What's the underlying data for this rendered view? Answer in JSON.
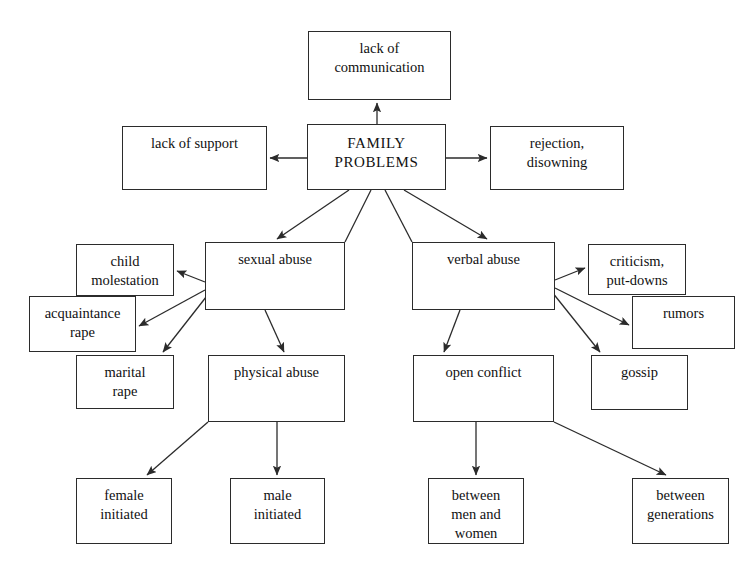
{
  "diagram": {
    "type": "concept-map",
    "title": "FAMILY PROBLEMS",
    "background_color": "#ffffff",
    "line_color": "#2b2b2b",
    "text_color": "#111111",
    "nodes": [
      {
        "id": "lack-of-communication",
        "label": "lack of\ncommunication",
        "x": 308,
        "y": 31,
        "w": 143,
        "h": 69,
        "level": "top"
      },
      {
        "id": "lack-of-support",
        "label": "lack of support",
        "x": 122,
        "y": 126,
        "w": 145,
        "h": 64,
        "level": "side"
      },
      {
        "id": "family-problems",
        "label": "FAMILY\nPROBLEMS",
        "x": 307,
        "y": 124,
        "w": 139,
        "h": 66,
        "level": "center"
      },
      {
        "id": "rejection-disowning",
        "label": "rejection,\ndisowning",
        "x": 490,
        "y": 126,
        "w": 134,
        "h": 64,
        "level": "side"
      },
      {
        "id": "sexual-abuse",
        "label": "sexual abuse",
        "x": 205,
        "y": 242,
        "w": 140,
        "h": 68,
        "level": "mid"
      },
      {
        "id": "verbal-abuse",
        "label": "verbal abuse",
        "x": 412,
        "y": 242,
        "w": 143,
        "h": 68,
        "level": "mid"
      },
      {
        "id": "child-molestation",
        "label": "child\nmolestation",
        "x": 76,
        "y": 244,
        "w": 98,
        "h": 52,
        "level": "leaf"
      },
      {
        "id": "acquaintance-rape",
        "label": "acquaintance\nrape",
        "x": 29,
        "y": 296,
        "w": 107,
        "h": 56,
        "level": "leaf"
      },
      {
        "id": "marital-rape",
        "label": "marital\nrape",
        "x": 76,
        "y": 355,
        "w": 98,
        "h": 54,
        "level": "leaf"
      },
      {
        "id": "criticism-put-downs",
        "label": "criticism,\nput-downs",
        "x": 588,
        "y": 244,
        "w": 98,
        "h": 51,
        "level": "leaf"
      },
      {
        "id": "rumors",
        "label": "rumors",
        "x": 632,
        "y": 296,
        "w": 103,
        "h": 53,
        "level": "leaf"
      },
      {
        "id": "gossip",
        "label": "gossip",
        "x": 591,
        "y": 355,
        "w": 97,
        "h": 55,
        "level": "leaf"
      },
      {
        "id": "physical-abuse",
        "label": "physical abuse",
        "x": 208,
        "y": 355,
        "w": 137,
        "h": 67,
        "level": "mid"
      },
      {
        "id": "open-conflict",
        "label": "open conflict",
        "x": 413,
        "y": 355,
        "w": 141,
        "h": 67,
        "level": "mid"
      },
      {
        "id": "female-initiated",
        "label": "female\ninitiated",
        "x": 76,
        "y": 478,
        "w": 96,
        "h": 66,
        "level": "leaf"
      },
      {
        "id": "male-initiated",
        "label": "male\ninitiated",
        "x": 230,
        "y": 478,
        "w": 95,
        "h": 66,
        "level": "leaf"
      },
      {
        "id": "between-men-and-women",
        "label": "between\nmen and\nwomen",
        "x": 428,
        "y": 478,
        "w": 96,
        "h": 66,
        "level": "leaf"
      },
      {
        "id": "between-generations",
        "label": "between\ngenerations",
        "x": 632,
        "y": 478,
        "w": 97,
        "h": 66,
        "level": "leaf"
      }
    ],
    "edges": [
      {
        "from": "family-problems",
        "to": "lack-of-communication",
        "x1": 377,
        "y1": 124,
        "x2": 377,
        "y2": 103
      },
      {
        "from": "family-problems",
        "to": "lack-of-support",
        "x1": 307,
        "y1": 158,
        "x2": 270,
        "y2": 158
      },
      {
        "from": "family-problems",
        "to": "rejection-disowning",
        "x1": 446,
        "y1": 158,
        "x2": 487,
        "y2": 158
      },
      {
        "from": "family-problems",
        "to": "sexual-abuse",
        "x1": 349,
        "y1": 190,
        "x2": 277,
        "y2": 239
      },
      {
        "from": "family-problems",
        "to": "verbal-abuse",
        "x1": 404,
        "y1": 190,
        "x2": 487,
        "y2": 239
      },
      {
        "from": "family-problems",
        "to": "sexual-abuse-corner",
        "x1": 371,
        "y1": 190,
        "x2": 345,
        "y2": 242,
        "arrow": false
      },
      {
        "from": "family-problems",
        "to": "verbal-abuse-corner",
        "x1": 385,
        "y1": 190,
        "x2": 412,
        "y2": 242,
        "arrow": false
      },
      {
        "from": "sexual-abuse",
        "to": "child-molestation",
        "x1": 205,
        "y1": 282,
        "x2": 177,
        "y2": 271
      },
      {
        "from": "sexual-abuse",
        "to": "acquaintance-rape",
        "x1": 205,
        "y1": 290,
        "x2": 139,
        "y2": 326
      },
      {
        "from": "sexual-abuse",
        "to": "marital-rape",
        "x1": 210,
        "y1": 292,
        "x2": 163,
        "y2": 352
      },
      {
        "from": "sexual-abuse",
        "to": "physical-abuse",
        "x1": 265,
        "y1": 310,
        "x2": 284,
        "y2": 352
      },
      {
        "from": "verbal-abuse",
        "to": "criticism-put-downs",
        "x1": 555,
        "y1": 280,
        "x2": 585,
        "y2": 268
      },
      {
        "from": "verbal-abuse",
        "to": "rumors",
        "x1": 555,
        "y1": 288,
        "x2": 629,
        "y2": 325
      },
      {
        "from": "verbal-abuse",
        "to": "gossip",
        "x1": 552,
        "y1": 292,
        "x2": 600,
        "y2": 352
      },
      {
        "from": "verbal-abuse",
        "to": "open-conflict",
        "x1": 460,
        "y1": 310,
        "x2": 444,
        "y2": 352
      },
      {
        "from": "physical-abuse",
        "to": "female-initiated",
        "x1": 208,
        "y1": 422,
        "x2": 147,
        "y2": 475
      },
      {
        "from": "physical-abuse",
        "to": "male-initiated",
        "x1": 277,
        "y1": 422,
        "x2": 277,
        "y2": 475
      },
      {
        "from": "open-conflict",
        "to": "between-men-and-women",
        "x1": 476,
        "y1": 422,
        "x2": 476,
        "y2": 475
      },
      {
        "from": "open-conflict",
        "to": "between-generations",
        "x1": 554,
        "y1": 422,
        "x2": 666,
        "y2": 475
      }
    ]
  }
}
